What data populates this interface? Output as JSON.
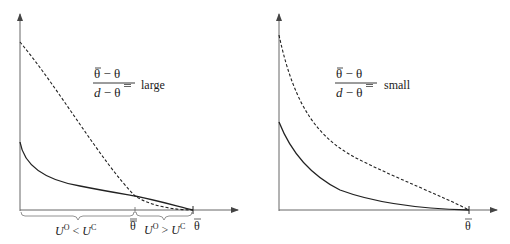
{
  "panels": [
    {
      "id": "left",
      "annotation": {
        "numerator": "θ̄ − θ",
        "denominator_var": "d",
        "denominator_rest": " − θ",
        "qualifier": "large"
      },
      "x_labels": {
        "theta_bar": "θ",
        "theta_double_bar": "θ",
        "region_left": {
          "U1": "U",
          "sup1": "O",
          "op": " < ",
          "U2": "U",
          "sup2": "C"
        },
        "region_right": {
          "U1": "U",
          "sup1": "O",
          "op": " > ",
          "U2": "U",
          "sup2": "C"
        }
      },
      "curves": [
        "solid",
        "dashed"
      ]
    },
    {
      "id": "right",
      "annotation": {
        "numerator": "θ̄ − θ",
        "denominator_var": "d",
        "denominator_rest": " − θ",
        "qualifier": "small"
      },
      "x_labels": {
        "theta_bar": "θ"
      },
      "curves": [
        "solid",
        "dashed"
      ]
    }
  ],
  "colors": {
    "axis": "#555555",
    "curve": "#222222"
  }
}
